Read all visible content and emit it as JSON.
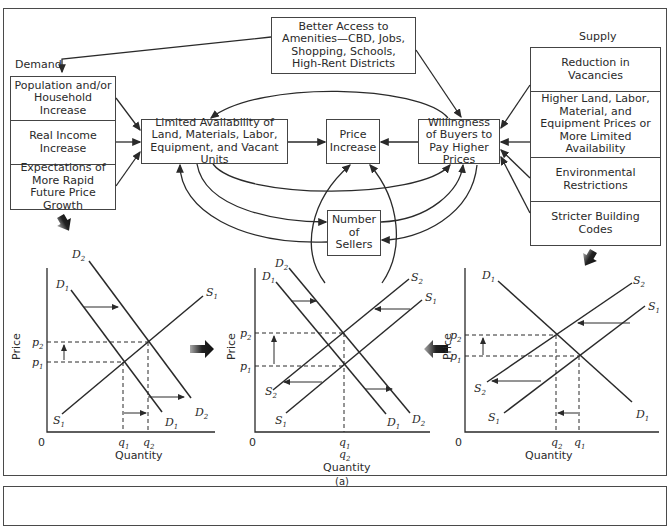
{
  "figure": {
    "caption": "(a)",
    "demand_heading": "Demand",
    "supply_heading": "Supply",
    "boxes": {
      "amenities": "Better Access to Amenities—CBD, Jobs, Shopping, Schools, High-Rent Districts",
      "population": "Population and/or Household Increase",
      "income": "Real Income Increase",
      "expectations": "Expectations of More Rapid Future Price Growth",
      "limited": "Limited Availability of Land, Materials, Labor, Equipment, and Vacant Units",
      "price_increase": "Price Increase",
      "willingness": "Willingness of Buyers to Pay Higher Prices",
      "sellers": "Number of Sellers",
      "vacancies": "Reduction in Vacancies",
      "higher_prices": "Higher Land, Labor, Material, and Equipment Prices or More Limited Availability",
      "environmental": "Environmental Restrictions",
      "building_codes": "Stricter Building Codes"
    },
    "graphs": [
      {
        "name": "demand-shift",
        "ylabel": "Price",
        "xlabel": "Quantity",
        "origin": "0",
        "curves": [
          "D1",
          "D2",
          "S1"
        ],
        "price_labels": [
          "p2",
          "p1"
        ],
        "quantity_labels": [
          "q1",
          "q2"
        ]
      },
      {
        "name": "demand-and-supply-shift",
        "ylabel": "Price",
        "xlabel": "Quantity",
        "origin": "0",
        "curves": [
          "D1",
          "D2",
          "S1",
          "S2"
        ],
        "price_labels": [
          "p2",
          "p1"
        ],
        "quantity_labels": [
          "q1",
          "q2"
        ]
      },
      {
        "name": "supply-shift",
        "ylabel": "Price",
        "xlabel": "Quantity",
        "origin": "0",
        "curves": [
          "D1",
          "S1",
          "S2"
        ],
        "price_labels": [
          "p2",
          "p1"
        ],
        "quantity_labels": [
          "q2",
          "q1"
        ]
      }
    ]
  }
}
